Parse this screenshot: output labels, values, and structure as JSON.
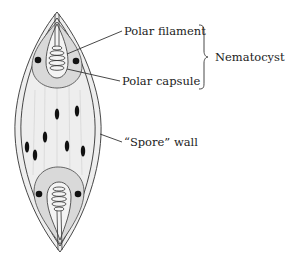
{
  "figure": {
    "labels": {
      "polar_filament": "Polar filament",
      "polar_capsule": "Polar capsule",
      "nematocyst": "Nematocyst",
      "spore_wall": "“Spore” wall"
    },
    "colors": {
      "ink": "#222222",
      "stipple": "#d9d9d9",
      "background": "#ffffff"
    },
    "structures": {
      "polar_capsules": 2,
      "capsule_nuclei_per_end": 2,
      "sporoplasm_nuclei": 7
    }
  }
}
